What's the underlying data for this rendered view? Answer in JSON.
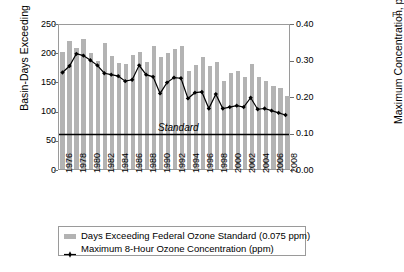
{
  "figure": {
    "axis_left_title": "Basin-Days Exceeding",
    "axis_right_title": "Maximum Concentration, ppm",
    "standard_annotation": "Standard",
    "right_cut_text": "F t a d E"
  },
  "legend": {
    "position": "below-plot",
    "items": [
      {
        "marker": "bar-swatch",
        "label": "Days Exceeding Federal Ozone Standard (0.075 ppm)"
      },
      {
        "marker": "line-marker",
        "label": "Maximum 8-Hour Ozone Concentration (ppm)"
      }
    ]
  },
  "colors": {
    "bar_fill": "#b3b3b3",
    "line_stroke": "#000000",
    "marker_fill": "#000000",
    "standard_line": "#000000",
    "frame": "#9a9a9a"
  },
  "chart_data": {
    "type": "bar",
    "title": "",
    "subtitle": "",
    "xlabel": "",
    "ylabel": "Basin-Days Exceeding",
    "ylabel_secondary": "Maximum Concentration, ppm",
    "grid": false,
    "legend_position": "bottom",
    "ylim": [
      0,
      250
    ],
    "yticks": [
      0,
      50,
      100,
      150,
      200,
      250
    ],
    "ytick_labels": [
      "0",
      "50",
      "100",
      "150",
      "200",
      "250"
    ],
    "ylim_secondary": [
      0.0,
      0.4
    ],
    "yticks_secondary": [
      0.0,
      0.1,
      0.2,
      0.3,
      0.4
    ],
    "ytick_labels_secondary": [
      "0.00",
      "0.10",
      "0.20",
      "0.30",
      "0.40"
    ],
    "x": [
      1976,
      1977,
      1978,
      1979,
      1980,
      1981,
      1982,
      1983,
      1984,
      1985,
      1986,
      1987,
      1988,
      1989,
      1990,
      1991,
      1992,
      1993,
      1994,
      1995,
      1996,
      1997,
      1998,
      1999,
      2000,
      2001,
      2002,
      2003,
      2004,
      2005,
      2006,
      2007,
      2008
    ],
    "xtick_labels": [
      "1976",
      "1978",
      "1980",
      "1982",
      "1984",
      "1986",
      "1988",
      "1990",
      "1992",
      "1994",
      "1996",
      "1998",
      "2000",
      "2002",
      "2004",
      "2006",
      "2008"
    ],
    "xtick_step_years": 2,
    "series": [
      {
        "name": "Days Exceeding Federal Ozone Standard (0.075 ppm)",
        "type": "bar",
        "axis": "left",
        "unit": "basin-days",
        "values": [
          201,
          220,
          208,
          222,
          198,
          185,
          216,
          193,
          182,
          180,
          195,
          200,
          183,
          210,
          191,
          198,
          206,
          210,
          168,
          178,
          192,
          176,
          183,
          150,
          164,
          168,
          157,
          180,
          158,
          150,
          142,
          138,
          125
        ]
      },
      {
        "name": "Maximum 8-Hour Ozone Concentration (ppm)",
        "type": "line",
        "axis": "right",
        "unit": "ppm",
        "values": [
          0.268,
          0.286,
          0.32,
          0.315,
          0.302,
          0.288,
          0.266,
          0.262,
          0.258,
          0.244,
          0.248,
          0.288,
          0.262,
          0.256,
          0.21,
          0.24,
          0.254,
          0.252,
          0.196,
          0.212,
          0.214,
          0.168,
          0.208,
          0.168,
          0.172,
          0.176,
          0.172,
          0.198,
          0.166,
          0.168,
          0.162,
          0.156,
          0.15
        ]
      }
    ],
    "reference_lines": [
      {
        "label": "Standard",
        "axis": "left",
        "value": 60,
        "value_secondary_ppm": 0.1,
        "style": "solid"
      }
    ]
  }
}
